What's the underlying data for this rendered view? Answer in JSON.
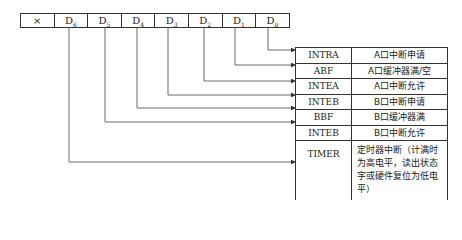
{
  "register": {
    "cells": [
      {
        "base": "×",
        "sub": ""
      },
      {
        "base": "D",
        "sub": "6"
      },
      {
        "base": "D",
        "sub": "5"
      },
      {
        "base": "D",
        "sub": "4"
      },
      {
        "base": "D",
        "sub": "3"
      },
      {
        "base": "D",
        "sub": "2"
      },
      {
        "base": "D",
        "sub": "1"
      },
      {
        "base": "D",
        "sub": "0"
      }
    ]
  },
  "table": {
    "rows": [
      {
        "signal": "INTRA",
        "desc": "A口中断申请"
      },
      {
        "signal": "ABF",
        "desc": "A口缓冲器满/空"
      },
      {
        "signal": "INTEA",
        "desc": "A口中断允许"
      },
      {
        "signal": "INTEB",
        "desc": "B口中断申请"
      },
      {
        "signal": "BBF",
        "desc": "B口缓冲器满"
      },
      {
        "signal": "INTEB",
        "desc": "B口中断允许"
      },
      {
        "signal": "TIMER",
        "desc": "定时器中断（计满时为高电平，读出状态字或硬件复位为低电平）"
      }
    ]
  }
}
